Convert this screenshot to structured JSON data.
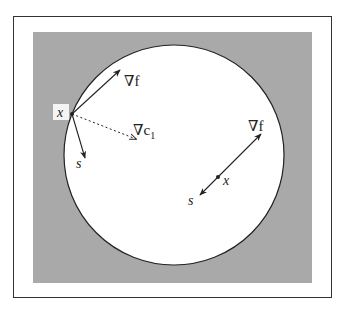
{
  "figure": {
    "colors": {
      "shaded_region": "#a9a9a9",
      "feasible_region": "#ffffff",
      "frame": "#333333",
      "ink": "#222222"
    },
    "boundary_point": {
      "label": "x",
      "grad_f_label": "∇f",
      "grad_c_label": "∇c",
      "grad_c_subscript": "1",
      "step_label": "s"
    },
    "interior_point": {
      "label": "x",
      "grad_f_label": "∇f",
      "step_label": "s"
    }
  }
}
